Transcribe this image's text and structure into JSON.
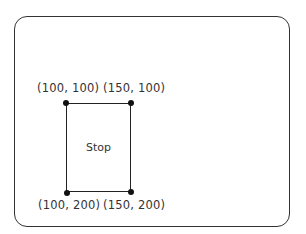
{
  "diagram": {
    "frame": {
      "shape": "rounded-rectangle",
      "border_color": "#333333"
    },
    "rectangle": {
      "label": "Stop",
      "corners": [
        {
          "id": "top-left",
          "label": "(100, 100)"
        },
        {
          "id": "top-right",
          "label": "(150, 100)"
        },
        {
          "id": "bottom-left",
          "label": "(100, 200)"
        },
        {
          "id": "bottom-right",
          "label": "(150, 200)"
        }
      ]
    }
  }
}
